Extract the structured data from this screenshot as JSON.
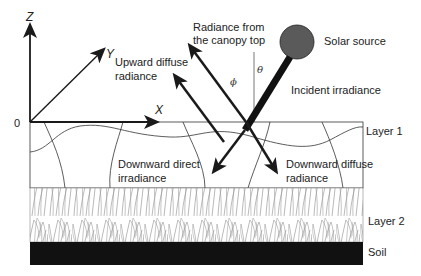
{
  "diagram": {
    "type": "canopy radiative transfer schematic",
    "axes": {
      "origin_label": "0",
      "x_label": "X",
      "y_label": "Y",
      "z_label": "Z"
    },
    "angles": {
      "phi": "ϕ",
      "theta": "θ"
    },
    "labels": {
      "radiance_top_line1": "Radiance from",
      "radiance_top_line2": "the canopy top",
      "solar_source": "Solar source",
      "upward_diffuse_line1": "Upward diffuse",
      "upward_diffuse_line2": "radiance",
      "incident_irradiance": "Incident irradiance",
      "downward_direct_line1": "Downward direct",
      "downward_direct_line2": "irradiance",
      "downward_diffuse_line1": "Downward diffuse",
      "downward_diffuse_line2": "radiance"
    },
    "layers": [
      {
        "name": "Layer 1"
      },
      {
        "name": "Layer 2"
      },
      {
        "name": "Soil"
      }
    ],
    "colors": {
      "line": "#1a1a1a",
      "sun": "#5a5a5a",
      "soil": "#111111",
      "grass": "#8a8a8a"
    }
  }
}
